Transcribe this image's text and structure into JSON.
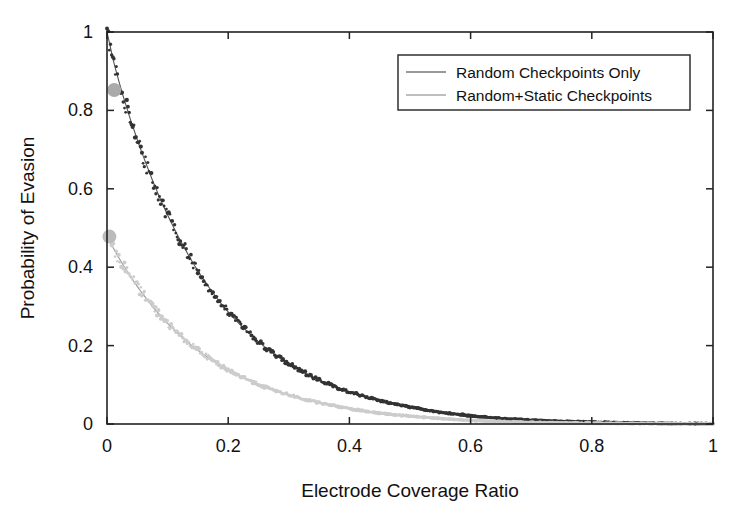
{
  "chart_data": {
    "type": "scatter",
    "title": "",
    "xlabel": "Electrode Coverage Ratio",
    "ylabel": "Probability of Evasion",
    "xlim": [
      0,
      1
    ],
    "ylim": [
      0,
      1
    ],
    "xticks": [
      "0",
      "0.2",
      "0.4",
      "0.6",
      "0.8",
      "1"
    ],
    "xtick_values": [
      0,
      0.2,
      0.4,
      0.6,
      0.8,
      1
    ],
    "yticks": [
      "0",
      "0.2",
      "0.4",
      "0.6",
      "0.8",
      "1"
    ],
    "ytick_values": [
      0,
      0.2,
      0.4,
      0.6,
      0.8,
      1
    ],
    "grid": false,
    "legend_position": "top-right-inside",
    "series": [
      {
        "name": "Random Checkpoints Only",
        "color": "#333333",
        "marker": "dot",
        "fit_color": "#555555",
        "x": [
          0.0,
          0.005,
          0.01,
          0.015,
          0.02,
          0.025,
          0.03,
          0.035,
          0.04,
          0.045,
          0.05,
          0.055,
          0.06,
          0.065,
          0.07,
          0.075,
          0.08,
          0.085,
          0.09,
          0.095,
          0.1,
          0.105,
          0.11,
          0.115,
          0.12,
          0.125,
          0.13,
          0.135,
          0.14,
          0.145,
          0.15,
          0.155,
          0.16,
          0.165,
          0.17,
          0.175,
          0.18,
          0.185,
          0.19,
          0.195,
          0.2,
          0.21,
          0.22,
          0.23,
          0.24,
          0.25,
          0.26,
          0.27,
          0.28,
          0.29,
          0.3,
          0.31,
          0.32,
          0.33,
          0.34,
          0.35,
          0.36,
          0.37,
          0.38,
          0.39,
          0.4,
          0.42,
          0.44,
          0.46,
          0.48,
          0.5,
          0.55,
          0.6,
          0.65,
          0.7,
          0.75,
          0.8,
          0.85,
          0.9,
          0.95,
          1.0
        ],
        "y": [
          1.0,
          0.965,
          0.93,
          0.9,
          0.872,
          0.845,
          0.82,
          0.795,
          0.77,
          0.748,
          0.725,
          0.703,
          0.682,
          0.662,
          0.642,
          0.622,
          0.603,
          0.585,
          0.567,
          0.55,
          0.533,
          0.517,
          0.501,
          0.486,
          0.471,
          0.457,
          0.443,
          0.429,
          0.416,
          0.403,
          0.391,
          0.379,
          0.367,
          0.356,
          0.345,
          0.334,
          0.324,
          0.314,
          0.304,
          0.295,
          0.286,
          0.269,
          0.253,
          0.238,
          0.223,
          0.21,
          0.197,
          0.185,
          0.174,
          0.164,
          0.154,
          0.144,
          0.136,
          0.127,
          0.12,
          0.112,
          0.106,
          0.099,
          0.093,
          0.088,
          0.082,
          0.072,
          0.064,
          0.056,
          0.049,
          0.043,
          0.03,
          0.021,
          0.014,
          0.01,
          0.007,
          0.005,
          0.003,
          0.002,
          0.001,
          0.001
        ]
      },
      {
        "name": "Random+Static Checkpoints",
        "color": "#cccccc",
        "marker": "dot",
        "fit_color": "#999999",
        "x": [
          0.0,
          0.005,
          0.01,
          0.015,
          0.02,
          0.025,
          0.03,
          0.035,
          0.04,
          0.045,
          0.05,
          0.055,
          0.06,
          0.065,
          0.07,
          0.075,
          0.08,
          0.085,
          0.09,
          0.095,
          0.1,
          0.105,
          0.11,
          0.115,
          0.12,
          0.125,
          0.13,
          0.135,
          0.14,
          0.145,
          0.15,
          0.155,
          0.16,
          0.165,
          0.17,
          0.175,
          0.18,
          0.185,
          0.19,
          0.195,
          0.2,
          0.21,
          0.22,
          0.23,
          0.24,
          0.25,
          0.26,
          0.27,
          0.28,
          0.29,
          0.3,
          0.31,
          0.32,
          0.33,
          0.34,
          0.35,
          0.36,
          0.38,
          0.4,
          0.42,
          0.44,
          0.46,
          0.48,
          0.5,
          0.55,
          0.6,
          0.7,
          0.8,
          0.9,
          1.0
        ],
        "y": [
          0.48,
          0.465,
          0.45,
          0.436,
          0.423,
          0.41,
          0.397,
          0.385,
          0.373,
          0.362,
          0.351,
          0.34,
          0.33,
          0.32,
          0.31,
          0.3,
          0.291,
          0.282,
          0.274,
          0.265,
          0.257,
          0.249,
          0.242,
          0.234,
          0.227,
          0.22,
          0.213,
          0.207,
          0.2,
          0.194,
          0.188,
          0.182,
          0.177,
          0.171,
          0.166,
          0.161,
          0.156,
          0.151,
          0.147,
          0.142,
          0.138,
          0.13,
          0.122,
          0.115,
          0.108,
          0.101,
          0.095,
          0.089,
          0.084,
          0.079,
          0.074,
          0.07,
          0.065,
          0.061,
          0.058,
          0.054,
          0.051,
          0.045,
          0.039,
          0.034,
          0.03,
          0.026,
          0.023,
          0.02,
          0.014,
          0.009,
          0.004,
          0.002,
          0.001,
          0.0
        ]
      }
    ],
    "highlight_points": [
      {
        "series": "Random Checkpoints Only",
        "x": 0.012,
        "y": 0.852,
        "color": "#aaaaaa",
        "radius": 7
      },
      {
        "series": "Random+Static Checkpoints",
        "x": 0.004,
        "y": 0.478,
        "color": "#bbbbbb",
        "radius": 7
      }
    ]
  },
  "legend": {
    "entries": [
      {
        "label": "Random Checkpoints Only",
        "color": "#777777"
      },
      {
        "label": "Random+Static Checkpoints",
        "color": "#aaaaaa"
      }
    ]
  },
  "colors": {
    "axis": "#222222",
    "background": "#ffffff",
    "series_dark": "#333333",
    "series_light": "#cccccc"
  }
}
